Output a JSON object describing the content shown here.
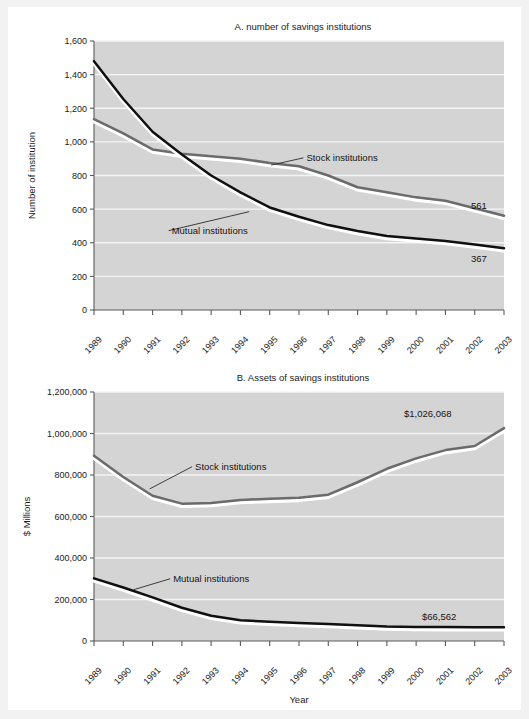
{
  "page": {
    "background": "#f2f2f2",
    "paper": "#ffffff"
  },
  "palette": {
    "plot_background": "#d4d4d4",
    "gridline": "#f4f4f4",
    "axis": "#5a5a5a",
    "stock_color": "#6b6b6b",
    "mutual_color": "#101010",
    "text": "#1a1a1a"
  },
  "chart_data": [
    {
      "id": "chart-a",
      "type": "line",
      "title": "A. number of savings institutions",
      "xlabel": "Year",
      "ylabel": "Number of institution",
      "x": [
        "1989",
        "1990",
        "1991",
        "1992",
        "1993",
        "1994",
        "1995",
        "1996",
        "1997",
        "1998",
        "1999",
        "2000",
        "2001",
        "2002",
        "2003"
      ],
      "xtick_labels": [
        "1989",
        "1990",
        "1991",
        "1992",
        "1993",
        "1994",
        "1995",
        "1996",
        "1997",
        "1998",
        "1999",
        "2000",
        "2001",
        "2002",
        "2003"
      ],
      "ylim": [
        0,
        1600
      ],
      "ytick_values": [
        0,
        200,
        400,
        600,
        800,
        1000,
        1200,
        1400,
        1600
      ],
      "ytick_labels": [
        "0",
        "200",
        "400",
        "600",
        "800",
        "1,000",
        "1,200",
        "1,400",
        "1,600"
      ],
      "grid": true,
      "legend_position": "inline-callout",
      "series": [
        {
          "name": "Stock institutions",
          "color": "#6b6b6b",
          "values": [
            1135,
            1050,
            955,
            930,
            915,
            900,
            875,
            855,
            800,
            730,
            700,
            670,
            650,
            605,
            561
          ],
          "end_label": "561",
          "callout": {
            "label": "Stock institutions",
            "label_x": 1996.15,
            "label_y": 905,
            "anchor_x": 1995.05,
            "anchor_y": 862
          }
        },
        {
          "name": "Mutual institutions",
          "color": "#101010",
          "values": [
            1480,
            1255,
            1060,
            925,
            800,
            700,
            610,
            555,
            505,
            470,
            440,
            425,
            410,
            390,
            367
          ],
          "end_label": "367",
          "callout": {
            "label": "Mutual institutions",
            "label_x": 1991.55,
            "label_y": 472,
            "anchor_x": 1994.3,
            "anchor_y": 585
          }
        }
      ]
    },
    {
      "id": "chart-b",
      "type": "line",
      "title": "B. Assets of savings institutions",
      "xlabel": "Year",
      "ylabel": "$ Millions",
      "x": [
        "1989",
        "1990",
        "1991",
        "1992",
        "1993",
        "1994",
        "1995",
        "1996",
        "1997",
        "1998",
        "1999",
        "2000",
        "2001",
        "2002",
        "2003"
      ],
      "xtick_labels": [
        "1989",
        "1990",
        "1991",
        "1992",
        "1993",
        "1994",
        "1995",
        "1996",
        "1997",
        "1998",
        "1999",
        "2000",
        "2001",
        "2002",
        "2003"
      ],
      "ylim": [
        0,
        1200000
      ],
      "ytick_values": [
        0,
        200000,
        400000,
        600000,
        800000,
        1000000,
        1200000
      ],
      "ytick_labels": [
        "0",
        "200,000",
        "400,000",
        "600,000",
        "800,000",
        "1,000,000",
        "1,200,000"
      ],
      "grid": true,
      "legend_position": "inline-callout",
      "series": [
        {
          "name": "Stock institutions",
          "color": "#6b6b6b",
          "values": [
            893000,
            790000,
            700000,
            662000,
            665000,
            680000,
            685000,
            690000,
            705000,
            765000,
            830000,
            880000,
            920000,
            940000,
            1026068
          ],
          "end_label": "$1,026,068",
          "callout": {
            "label": "Stock institutions",
            "label_x": 1992.35,
            "label_y": 840000,
            "anchor_x": 1990.9,
            "anchor_y": 733000
          }
        },
        {
          "name": "Mutual institutions",
          "color": "#101010",
          "values": [
            302000,
            258000,
            210000,
            160000,
            122000,
            100000,
            93000,
            87000,
            82000,
            76000,
            70000,
            68000,
            67000,
            66800,
            66562
          ],
          "end_label": "$66,562",
          "callout": {
            "label": "Mutual institutions",
            "label_x": 1991.6,
            "label_y": 300000,
            "anchor_x": 1990.35,
            "anchor_y": 247000
          }
        }
      ]
    }
  ]
}
